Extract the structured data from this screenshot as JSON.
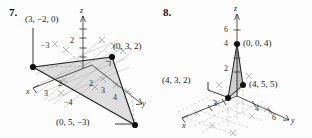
{
  "figures": [
    {
      "number": "7.",
      "axes": {
        "x": "x",
        "y": "y",
        "z": "z"
      },
      "tick_labels": [
        "−3",
        "2",
        "2",
        "2",
        "3",
        "3",
        "4",
        "−4"
      ],
      "point_labels": [
        {
          "text": "(3, −2, 0)"
        },
        {
          "text": "(0, 3, 2)"
        },
        {
          "text": "(0, 5, −3)"
        }
      ]
    },
    {
      "number": "8.",
      "axes": {
        "x": "x",
        "y": "y",
        "z": "z"
      },
      "tick_labels": [
        "6",
        "4",
        "2",
        "3",
        "4",
        "6"
      ],
      "point_labels": [
        {
          "text": "(0, 0, 4)"
        },
        {
          "text": "(4, 3, 2)"
        },
        {
          "text": "(4, 5, 5)"
        }
      ]
    }
  ],
  "fig7": {
    "num": "7.",
    "label_a": "(3, −2, 0)",
    "label_b": "(0, 3, 2)",
    "label_c": "(0, 5, −3)",
    "axis_x": "x",
    "axis_y": "y",
    "axis_z": "z",
    "t_neg3": "−3",
    "t_z2": "2",
    "t_g2a": "2",
    "t_g2b": "2",
    "t_x3": "3",
    "t_y3": "3",
    "t_y4": "4",
    "t_neg4": "−4"
  },
  "fig8": {
    "num": "8.",
    "label_a": "(0, 0, 4)",
    "label_b": "(4, 3, 2)",
    "label_c": "(4, 5, 5)",
    "axis_x": "x",
    "axis_y": "y",
    "axis_z": "z",
    "t_z6": "6",
    "t_z4": "4",
    "t_z2": "2",
    "t_x3": "3",
    "t_y4": "4",
    "t_y6": "6"
  },
  "colors": {
    "ink": "#1a1a1a",
    "grid": "#9a9a9a",
    "fill": "#d9d9d9",
    "fill_dark": "#bdbdbd",
    "dash": "#b0b0b0"
  }
}
